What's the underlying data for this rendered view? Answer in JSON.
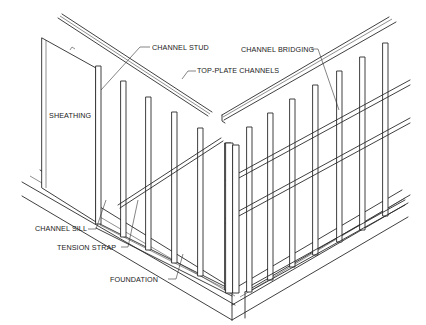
{
  "diagram": {
    "labels": {
      "channel_stud": "CHANNEL STUD",
      "top_plate_channels": "TOP-PLATE CHANNELS",
      "channel_bridging": "CHANNEL BRIDGING",
      "sheathing": "SHEATHING",
      "channel_sill": "CHANNEL SILL",
      "tension_strap": "TENSION STRAP",
      "foundation": "FOUNDATION"
    },
    "colors": {
      "line": "#2a2a2a",
      "background": "#ffffff",
      "text": "#222222"
    }
  }
}
